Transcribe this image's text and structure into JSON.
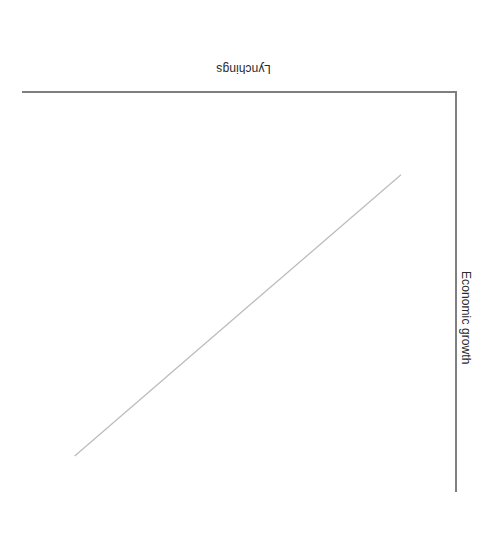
{
  "figure": {
    "orientation": "rotated-180",
    "background_color": "#ffffff",
    "axis_color": "#7f7f7f",
    "line_color": "#bdbdbd",
    "label_color": "#2b2b2b"
  },
  "axes": {
    "x_label": "Lynchings",
    "y_label": "Economic growth"
  },
  "chart_data": {
    "type": "line",
    "title": "",
    "subtitle": "",
    "xlabel": "Lynchings",
    "ylabel": "Economic growth",
    "x": [
      0.08,
      1.0
    ],
    "series": [
      {
        "name": "Trend",
        "x": [
          0.08,
          1.0
        ],
        "values": [
          0.12,
          0.96
        ],
        "color": "#bdbdbd",
        "style": "solid",
        "markers": false,
        "width": 1
      }
    ],
    "xlim": [
      0,
      1
    ],
    "ylim": [
      0,
      1
    ],
    "x_tick_labels": [],
    "y_tick_labels": [],
    "grid": false,
    "legend": false,
    "legend_position": "none",
    "annotations": []
  }
}
